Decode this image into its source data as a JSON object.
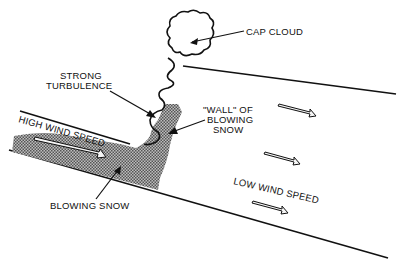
{
  "labels": {
    "cap_cloud": "CAP CLOUD",
    "strong_turbulence_1": "STRONG",
    "strong_turbulence_2": "TURBULENCE",
    "wall_1": "\"WALL\" OF",
    "wall_2": "BLOWING",
    "wall_3": "SNOW",
    "high_wind": "HIGH WIND SPEED",
    "blowing_snow": "BLOWING SNOW",
    "low_wind": "LOW WIND SPEED"
  },
  "colors": {
    "ink": "#111111",
    "snow_fill": "#8a8a8a",
    "background": "#ffffff"
  }
}
